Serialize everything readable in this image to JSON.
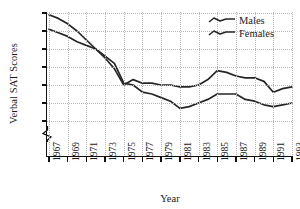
{
  "chart_data": {
    "type": "line",
    "title": "",
    "xlabel": "Year",
    "ylabel": "Verbal SAT Scores",
    "x": [
      1967,
      1968,
      1969,
      1970,
      1971,
      1972,
      1973,
      1974,
      1975,
      1976,
      1977,
      1978,
      1979,
      1980,
      1981,
      1982,
      1983,
      1984,
      1985,
      1986,
      1987,
      1988,
      1989,
      1990,
      1991,
      1992,
      1993
    ],
    "xlim": [
      1967,
      1993
    ],
    "ylim": [
      410,
      470
    ],
    "y_break_below": 410,
    "y_zero_shown": true,
    "grid": true,
    "legend_position": "top-right",
    "xticks": [
      "1967",
      "1969",
      "1971",
      "1973",
      "1975",
      "1977",
      "1979",
      "1981",
      "1983",
      "1985",
      "1987",
      "1989",
      "1991",
      "1993"
    ],
    "yticks": [
      "0",
      "410",
      "420",
      "430",
      "440",
      "450",
      "460",
      "470"
    ],
    "series": [
      {
        "name": "Males",
        "values": [
          469,
          467,
          464,
          460,
          455,
          450,
          445,
          439,
          430,
          433,
          431,
          431,
          430,
          430,
          429,
          429,
          430,
          433,
          438,
          437,
          435,
          434,
          434,
          432,
          426,
          428,
          429
        ]
      },
      {
        "name": "Females",
        "values": [
          461,
          459,
          457,
          454,
          452,
          450,
          446,
          442,
          431,
          430,
          426,
          425,
          423,
          421,
          417,
          418,
          420,
          422,
          425,
          425,
          425,
          422,
          421,
          419,
          418,
          419,
          420
        ]
      }
    ]
  },
  "axis": {
    "y_title": "Verbal SAT Scores",
    "x_title": "Year",
    "y_tick_labels": [
      "470",
      "460",
      "450",
      "440",
      "430",
      "420",
      "410",
      "0"
    ],
    "x_tick_labels": [
      "1967",
      "1969",
      "1971",
      "1973",
      "1975",
      "1977",
      "1979",
      "1981",
      "1983",
      "1985",
      "1987",
      "1989",
      "1991",
      "1993"
    ]
  },
  "legend": {
    "items": [
      {
        "label": "Males",
        "swatch": "wavy-line-sample"
      },
      {
        "label": "Females",
        "swatch": "wavy-line-sample"
      }
    ]
  },
  "colors": {
    "line": "#262626",
    "grid": "#b8b8b8",
    "axis": "#111111",
    "background": "#ffffff"
  }
}
